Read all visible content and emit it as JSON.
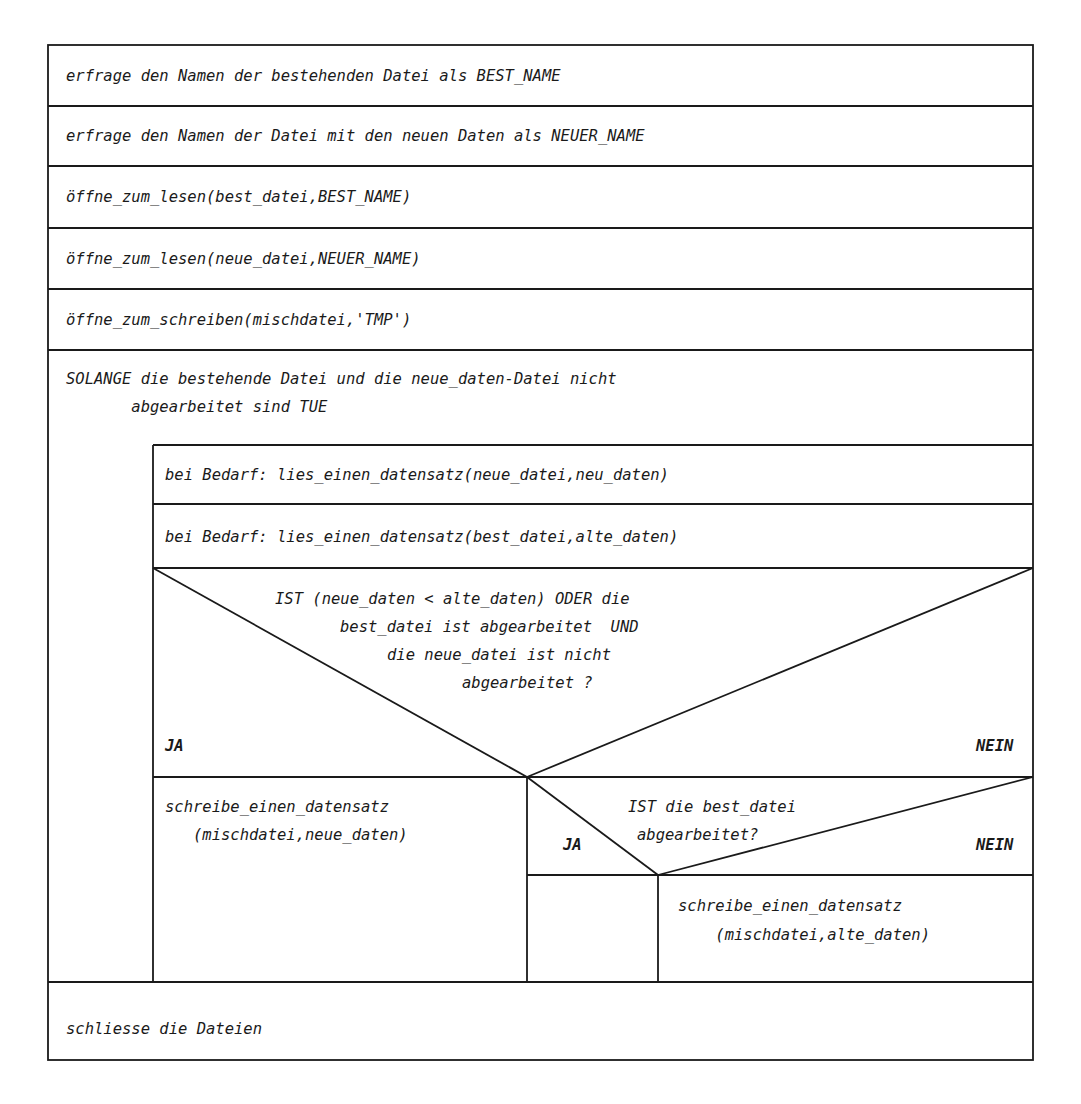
{
  "structogram": {
    "steps": [
      "erfrage den Namen der bestehenden Datei als BEST_NAME",
      "erfrage den Namen der Datei mit den neuen Daten als NEUER_NAME",
      "öffne_zum_lesen(best_datei,BEST_NAME)",
      "öffne_zum_lesen(neue_datei,NEUER_NAME)",
      "öffne_zum_schreiben(mischdatei,'TMP')"
    ],
    "loop": {
      "condition_line1": "SOLANGE die bestehende Datei und die neue_daten-Datei nicht",
      "condition_line2": "       abgearbeitet sind TUE",
      "body": [
        "bei Bedarf: lies_einen_datensatz(neue_datei,neu_daten)",
        "bei Bedarf: lies_einen_datensatz(best_datei,alte_daten)"
      ],
      "decision1": {
        "lines": [
          "IST (neue_daten < alte_daten) ODER die",
          "best_datei ist abgearbeitet  UND",
          "die neue_datei ist nicht",
          "abgearbeitet ?"
        ],
        "yes_label": "JA",
        "no_label": "NEIN",
        "yes_action_line1": "schreibe_einen_datensatz",
        "yes_action_line2": "   (mischdatei,neue_daten)"
      },
      "decision2": {
        "line1": "IST die best_datei",
        "line2": "abgearbeitet?",
        "yes_label": "JA",
        "no_label": "NEIN",
        "no_action_line1": "schreibe_einen_datensatz",
        "no_action_line2": "    (mischdatei,alte_daten)"
      }
    },
    "final_step": "schliesse die Dateien"
  }
}
